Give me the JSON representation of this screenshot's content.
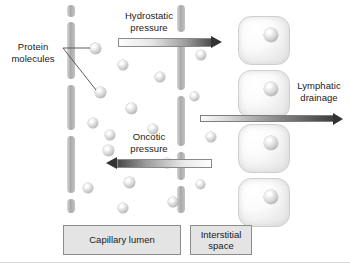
{
  "diagram": {
    "background": "#ffffff"
  },
  "labels": {
    "protein_molecules": "Protein\nmolecules",
    "hydrostatic_pressure": "Hydrostatic\npressure",
    "oncotic_pressure": "Oncotic\npressure",
    "lymphatic_drainage": "Lymphatic\ndrainage"
  },
  "captions": {
    "capillary_lumen": "Capillary lumen",
    "interstitial_space": "Interstitial\nspace"
  },
  "colors": {
    "wall": "#a9a9a9",
    "sphere": "#d2d2d2",
    "cell_fill": "#efefef",
    "cell_border": "#cfcfcf",
    "arrow_dark": "#333333",
    "caption_fill": "#e4e4e4",
    "caption_border": "#8c8c8c",
    "text": "#1a1a1a"
  },
  "arrows": [
    {
      "name": "hydrostatic-pressure-arrow",
      "direction": "right",
      "label": "Hydrostatic pressure"
    },
    {
      "name": "oncotic-pressure-arrow",
      "direction": "left",
      "label": "Oncotic pressure"
    },
    {
      "name": "lymphatic-drainage-arrow",
      "direction": "right",
      "label": "Lymphatic drainage"
    }
  ],
  "structures": {
    "capillary_wall_left_segments": 5,
    "capillary_wall_right_segments": 5,
    "interstitial_cells": 4,
    "protein_spheres_total": 20
  }
}
